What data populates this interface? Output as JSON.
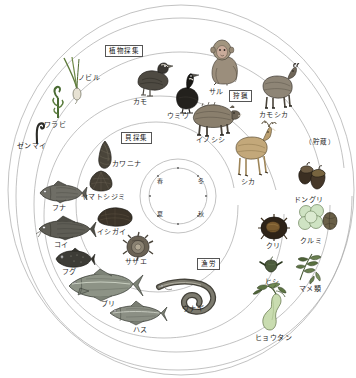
{
  "diagram": {
    "type": "seasonal-subsistence-wheel",
    "background_color": "#ffffff",
    "line_color": "#9a9a9a"
  },
  "zones": [
    {
      "id": "plant-gathering",
      "label": "植物採集",
      "boxed": true
    },
    {
      "id": "hunting",
      "label": "狩猟",
      "boxed": true
    },
    {
      "id": "shell-gathering",
      "label": "貝採集",
      "boxed": true
    },
    {
      "id": "fishing",
      "label": "漁労",
      "boxed": true
    },
    {
      "id": "storage",
      "label": "（貯蔵）",
      "boxed": false
    }
  ],
  "seasons": [
    {
      "id": "spring",
      "label": "春"
    },
    {
      "id": "winter",
      "label": "冬"
    },
    {
      "id": "summer",
      "label": "夏"
    },
    {
      "id": "autumn",
      "label": "秋"
    }
  ],
  "items": [
    {
      "id": "nobiru",
      "label": "ノビル",
      "group": "plant-gathering"
    },
    {
      "id": "warabi",
      "label": "ワラビ",
      "group": "plant-gathering"
    },
    {
      "id": "zenmai",
      "label": "ゼンマイ",
      "group": "plant-gathering"
    },
    {
      "id": "kamo",
      "label": "カモ",
      "group": "hunting"
    },
    {
      "id": "umiu",
      "label": "ウミウ",
      "group": "hunting"
    },
    {
      "id": "saru",
      "label": "サル",
      "group": "hunting"
    },
    {
      "id": "kamoshika",
      "label": "カモシカ",
      "group": "hunting"
    },
    {
      "id": "inoshishi",
      "label": "イノシシ",
      "group": "hunting"
    },
    {
      "id": "shika",
      "label": "シカ",
      "group": "hunting"
    },
    {
      "id": "kawanina",
      "label": "カワニナ",
      "group": "shell-gathering"
    },
    {
      "id": "yamatoshijimi",
      "label": "ヤマトシジミ",
      "group": "shell-gathering"
    },
    {
      "id": "ishigai",
      "label": "イシガイ",
      "group": "shell-gathering"
    },
    {
      "id": "sazae",
      "label": "サザエ",
      "group": "shell-gathering"
    },
    {
      "id": "funa",
      "label": "フナ",
      "group": "fishing"
    },
    {
      "id": "koi",
      "label": "コイ",
      "group": "fishing"
    },
    {
      "id": "fugu",
      "label": "フグ",
      "group": "fishing"
    },
    {
      "id": "buri",
      "label": "ブリ",
      "group": "fishing"
    },
    {
      "id": "hasu",
      "label": "ハス",
      "group": "fishing"
    },
    {
      "id": "unagi",
      "label": "ウナギ",
      "group": "fishing"
    },
    {
      "id": "donguri",
      "label": "ドングリ",
      "group": "storage"
    },
    {
      "id": "kuri",
      "label": "クリ",
      "group": "storage"
    },
    {
      "id": "kurumi",
      "label": "クルミ",
      "group": "storage"
    },
    {
      "id": "hishi",
      "label": "ヒシ",
      "group": "storage"
    },
    {
      "id": "mamerui",
      "label": "マメ類",
      "group": "storage"
    },
    {
      "id": "hyoutan",
      "label": "ヒョウタン",
      "group": "storage"
    }
  ]
}
